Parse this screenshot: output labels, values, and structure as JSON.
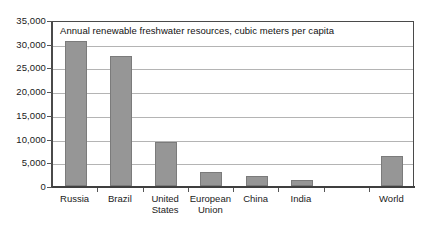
{
  "chart_data": {
    "type": "bar",
    "title": "Annual renewable freshwater resources, cubic meters per capita",
    "xlabel": "",
    "ylabel": "",
    "grid": true,
    "legend": false,
    "ylim": [
      0,
      35000
    ],
    "ytick_step": 5000,
    "ytick_labels": [
      "35,000",
      "30,000",
      "25,000",
      "20,000",
      "15,000",
      "10,000",
      "5,000",
      "0"
    ],
    "ytick_values": [
      35000,
      30000,
      25000,
      20000,
      15000,
      10000,
      5000,
      0
    ],
    "categories": [
      "Russia",
      "Brazil",
      "United States",
      "European Union",
      "China",
      "India",
      "",
      "World"
    ],
    "category_lines": [
      [
        "Russia"
      ],
      [
        "Brazil"
      ],
      [
        "United",
        "States"
      ],
      [
        "European",
        "Union"
      ],
      [
        "China"
      ],
      [
        "India"
      ],
      [
        ""
      ],
      [
        "World"
      ]
    ],
    "values": [
      30500,
      27500,
      9300,
      3000,
      2200,
      1200,
      null,
      6300
    ],
    "series": [
      {
        "name": "Annual renewable freshwater resources",
        "values": [
          30500,
          27500,
          9300,
          3000,
          2200,
          1200,
          null,
          6300
        ]
      }
    ],
    "colors": {
      "bar_fill": "#969696",
      "bar_border": "#7b7b7b",
      "gridline": "#b4b4b4",
      "axis": "#4a4a4a",
      "background": "#ffffff",
      "text": "#111111"
    }
  }
}
